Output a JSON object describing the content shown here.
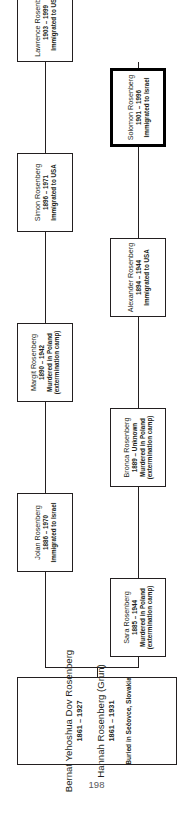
{
  "page": {
    "number": "198"
  },
  "chart": {
    "type": "genealogy-tree",
    "orientation": "rotated-90-ccw",
    "parents": {
      "father": {
        "name": "Bernat Yehoshua Dov Rosenberg",
        "dates": "1861 – 1927"
      },
      "mother": {
        "name": "Hannah Rosenberg (Grun)",
        "dates": "1861 – 1931"
      },
      "buried": "Buried in Sečovce, Slovakia"
    },
    "children": [
      {
        "name": "Sara Rosenberg",
        "dates": "1885 – 1944",
        "note": "Murdered in Poland",
        "note2": "(extermination camp)",
        "highlight": false
      },
      {
        "name": "Jolan Rosenberg",
        "dates": "1886 – 1970",
        "note": "Immigrated to Israel",
        "note2": "",
        "highlight": false
      },
      {
        "name": "Bronca Rosenberg",
        "dates": "1889 – Unknown",
        "note": "Murdered in Poland",
        "note2": "(extermination camp)",
        "highlight": false
      },
      {
        "name": "Margit Rosenberg",
        "dates": "1890 – 1942",
        "note": "Murdered in Poland",
        "note2": "(extermination camp)",
        "highlight": false
      },
      {
        "name": "Alexander Rosenberg",
        "dates": "1894 – 1944",
        "note": "Immigrated to USA",
        "note2": "",
        "highlight": false
      },
      {
        "name": "Simon Rosenberg",
        "dates": "1896 – 1971",
        "note": "Immigrated to USA",
        "note2": "",
        "highlight": false
      },
      {
        "name": "Solomon Rosenberg",
        "dates": "1901 – 1996",
        "note": "Immigrated to Israel",
        "note2": "",
        "highlight": true
      },
      {
        "name": "Lawrence Rosenberg",
        "dates": "1903 – 1999",
        "note": "Immigrated to USA",
        "note2": "",
        "highlight": false
      }
    ]
  },
  "colors": {
    "ink": "#231f20",
    "page_number": "#58595b",
    "highlight_border": "#000000",
    "background": "#ffffff"
  }
}
